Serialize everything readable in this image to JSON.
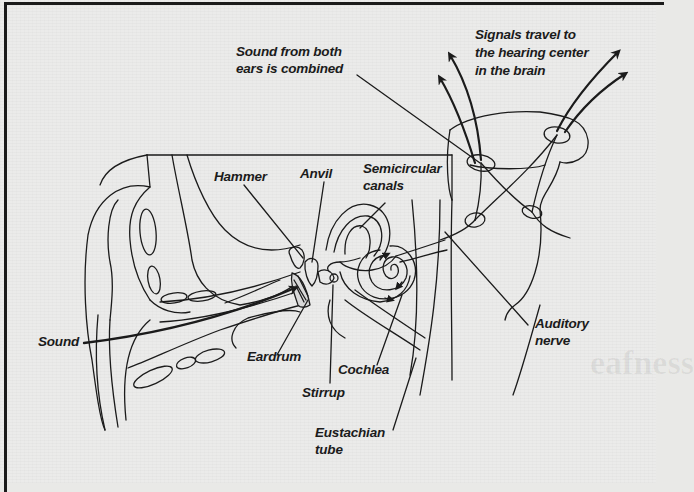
{
  "figure": {
    "background_color": "#ebebea",
    "line_color": "#1b1b1b"
  },
  "labels": {
    "sound_combined": {
      "line1": "Sound from both",
      "line2": "ears is combined"
    },
    "signals_travel": {
      "line1": "Signals travel to",
      "line2": "the hearing center",
      "line3": "in the brain"
    },
    "hammer": "Hammer",
    "anvil": "Anvil",
    "semicircular": {
      "line1": "Semicircular",
      "line2": "canals"
    },
    "sound": "Sound",
    "eardrum": "Eardrum",
    "stirrup": "Stirrup",
    "cochlea": "Cochlea",
    "auditory_nerve": {
      "line1": "Auditory",
      "line2": "nerve"
    },
    "eustachian": {
      "line1": "Eustachian",
      "line2": "tube"
    }
  },
  "background_text": {
    "heading_fragment": "eafness"
  }
}
